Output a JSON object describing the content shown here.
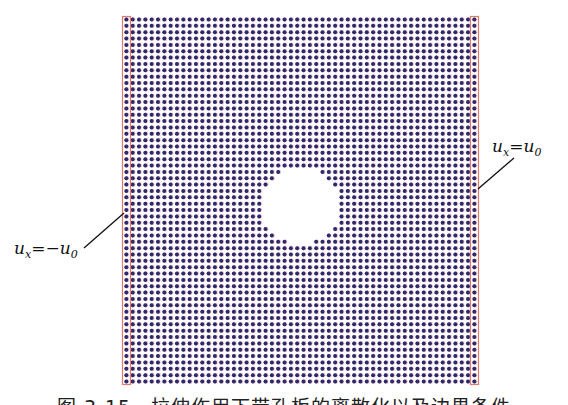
{
  "figure": {
    "caption": "图 3-15　拉伸作用下带孔板的离散化以及边界条件",
    "grid": {
      "columns": 56,
      "rows": 58,
      "hole_radius_in_spacings": 6.1,
      "hole_center_fraction": [
        0.5,
        0.515
      ]
    },
    "colors": {
      "particle": "#2b2a6b",
      "particle_halo": "#d46a8a",
      "boundary_box": "#e07a6a",
      "leader_line": "#111111"
    },
    "boundary_conditions": [
      {
        "side": "left",
        "label_var": "u",
        "label_sub": "x",
        "label_eq": "=",
        "label_rhs": "−u",
        "label_rhs_sub": "0"
      },
      {
        "side": "right",
        "label_var": "u",
        "label_sub": "x",
        "label_eq": "=",
        "label_rhs": "u",
        "label_rhs_sub": "0"
      }
    ]
  }
}
